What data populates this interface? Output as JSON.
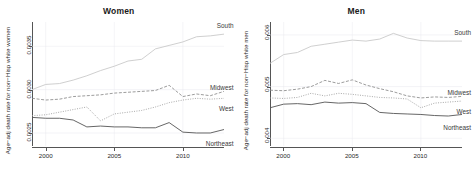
{
  "figure": {
    "panels": [
      {
        "key": "women",
        "title": "Women",
        "ylabel": "Age−adj death rate for non−Hisp white women",
        "yticks": [
          "0.0025",
          "0.0030",
          "0.0035"
        ],
        "ytick_values": [
          0.0025,
          0.003,
          0.0035
        ],
        "xticks": [
          "2000",
          "2005",
          "2010"
        ],
        "xtick_values": [
          2000,
          2005,
          2010
        ],
        "series_labels": {
          "south": "South",
          "midwest": "Midwest",
          "west": "West",
          "northeast": "Northeast"
        }
      },
      {
        "key": "men",
        "title": "Men",
        "ylabel": "Age−adj death rate for non−Hisp white men",
        "yticks": [
          "0.004",
          "0.005",
          "0.006"
        ],
        "ytick_values": [
          0.004,
          0.005,
          0.006
        ],
        "xticks": [
          "2000",
          "2005",
          "2010"
        ],
        "xtick_values": [
          2000,
          2005,
          2010
        ],
        "series_labels": {
          "south": "South",
          "midwest": "Midwest",
          "west": "West",
          "northeast": "Northeast"
        }
      }
    ],
    "colors": {
      "south": "#c9c9c9",
      "midwest": "#8a8a8a",
      "west": "#9a9a9a",
      "northeast": "#555555",
      "grid": "#e9e9ef",
      "axis": "#555555",
      "text": "#2a2a2a"
    }
  },
  "chart_data": [
    {
      "type": "line",
      "title": "Women",
      "xlabel": "",
      "ylabel": "Age−adj death rate for non−Hisp white women",
      "xlim": [
        1999,
        2013
      ],
      "ylim": [
        0.00235,
        0.00378
      ],
      "xticks": [
        2000,
        2005,
        2010
      ],
      "yticks": [
        0.0025,
        0.003,
        0.0035
      ],
      "grid": true,
      "legend": "inline-right-labels",
      "x": [
        1999,
        2000,
        2001,
        2002,
        2003,
        2004,
        2005,
        2006,
        2007,
        2008,
        2009,
        2010,
        2011,
        2012,
        2013
      ],
      "series": [
        {
          "name": "South",
          "style": "solid",
          "color": "#c9c9c9",
          "values": [
            0.003,
            0.00306,
            0.00307,
            0.00311,
            0.00316,
            0.00322,
            0.00327,
            0.00333,
            0.00335,
            0.00347,
            0.00351,
            0.00355,
            0.00361,
            0.00362,
            0.00364
          ]
        },
        {
          "name": "Midwest",
          "style": "dashed",
          "color": "#8a8a8a",
          "values": [
            0.0029,
            0.00288,
            0.00289,
            0.00292,
            0.00293,
            0.00294,
            0.00296,
            0.00297,
            0.00298,
            0.00299,
            0.00305,
            0.00292,
            0.00295,
            0.00293,
            0.00298
          ]
        },
        {
          "name": "West",
          "style": "dotted",
          "color": "#9a9a9a",
          "values": [
            0.0027,
            0.00271,
            0.00274,
            0.00277,
            0.0028,
            0.00264,
            0.00272,
            0.00274,
            0.00276,
            0.0028,
            0.00285,
            0.00288,
            0.0029,
            0.00289,
            0.0029
          ]
        },
        {
          "name": "Northeast",
          "style": "solid",
          "color": "#555555",
          "values": [
            0.00268,
            0.00267,
            0.00267,
            0.00265,
            0.00257,
            0.00258,
            0.00257,
            0.00257,
            0.00256,
            0.00256,
            0.00262,
            0.00251,
            0.0025,
            0.0025,
            0.00254
          ]
        }
      ]
    },
    {
      "type": "line",
      "title": "Men",
      "xlabel": "",
      "ylabel": "Age−adj death rate for non−Hisp white men",
      "xlim": [
        1999,
        2013
      ],
      "ylim": [
        0.00385,
        0.00625
      ],
      "xticks": [
        2000,
        2005,
        2010
      ],
      "yticks": [
        0.004,
        0.005,
        0.006
      ],
      "grid": true,
      "legend": "inline-right-labels",
      "x": [
        1999,
        2000,
        2001,
        2002,
        2003,
        2004,
        2005,
        2006,
        2007,
        2008,
        2009,
        2010,
        2011,
        2012,
        2013
      ],
      "series": [
        {
          "name": "South",
          "style": "solid",
          "color": "#c9c9c9",
          "values": [
            0.00545,
            0.00562,
            0.00566,
            0.00578,
            0.00582,
            0.00586,
            0.0059,
            0.00588,
            0.00592,
            0.00603,
            0.00594,
            0.00589,
            0.00588,
            0.00588,
            0.00588
          ]
        },
        {
          "name": "Midwest",
          "style": "dashed",
          "color": "#8a8a8a",
          "values": [
            0.00493,
            0.00492,
            0.00495,
            0.005,
            0.00512,
            0.00506,
            0.00513,
            0.00503,
            0.00496,
            0.0049,
            0.00482,
            0.00478,
            0.0048,
            0.00479,
            0.00481
          ]
        },
        {
          "name": "West",
          "style": "dotted",
          "color": "#9a9a9a",
          "values": [
            0.00478,
            0.00477,
            0.00479,
            0.00487,
            0.00482,
            0.00487,
            0.00485,
            0.00482,
            0.00479,
            0.00478,
            0.00476,
            0.00459,
            0.00468,
            0.0047,
            0.00472
          ]
        },
        {
          "name": "Northeast",
          "style": "solid",
          "color": "#555555",
          "values": [
            0.00459,
            0.00466,
            0.00467,
            0.00465,
            0.0047,
            0.00468,
            0.00469,
            0.00467,
            0.0045,
            0.00448,
            0.00447,
            0.00446,
            0.00444,
            0.00443,
            0.00446
          ]
        }
      ]
    }
  ]
}
